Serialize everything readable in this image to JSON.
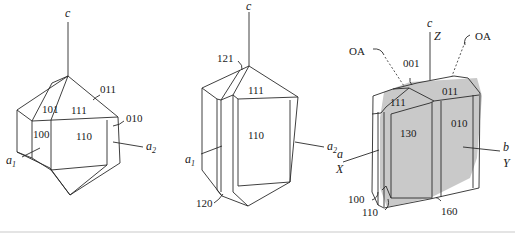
{
  "figure": {
    "crystals": [
      {
        "name": "dipyramidal-crystal",
        "axes": {
          "c": "c",
          "a1": "a",
          "a1_sub": "1",
          "a2": "a",
          "a2_sub": "2"
        },
        "faces": [
          "011",
          "101",
          "111",
          "010",
          "100",
          "110"
        ]
      },
      {
        "name": "prismatic-crystal",
        "axes": {
          "c": "c",
          "a1": "a",
          "a1_sub": "1",
          "a2": "a",
          "a2_sub": "2"
        },
        "faces": [
          "121",
          "111",
          "110",
          "120"
        ]
      },
      {
        "name": "tabular-crystal",
        "axes": {
          "c": "c",
          "Z": "Z",
          "a": "a",
          "X": "X",
          "b": "b",
          "Y": "Y"
        },
        "optic_axes": [
          "OA",
          "OA"
        ],
        "faces": [
          "001",
          "111",
          "011",
          "130",
          "010",
          "100",
          "110",
          "160"
        ]
      }
    ]
  }
}
